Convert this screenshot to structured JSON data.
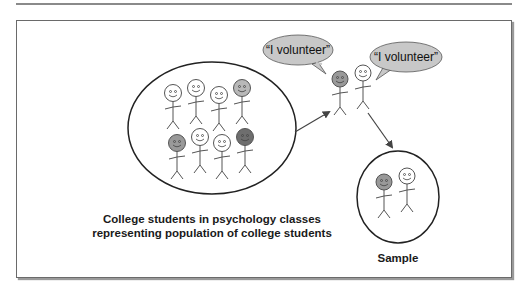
{
  "diagram": {
    "population": {
      "caption_line1": "College students in psychology classes",
      "caption_line2": "representing population of college students",
      "figures": [
        {
          "head": "white"
        },
        {
          "head": "white"
        },
        {
          "head": "white"
        },
        {
          "head": "light-gray"
        },
        {
          "head": "gray"
        },
        {
          "head": "white"
        },
        {
          "head": "white"
        },
        {
          "head": "dark-gray"
        }
      ]
    },
    "volunteers": {
      "bubble1_text": "“I volunteer”",
      "bubble2_text": "“I volunteer”",
      "figures": [
        {
          "head": "gray"
        },
        {
          "head": "white"
        }
      ]
    },
    "sample": {
      "label": "Sample",
      "figures": [
        {
          "head": "gray"
        },
        {
          "head": "white"
        }
      ]
    },
    "colors": {
      "bubble_fill": "#c8c8c8",
      "head_white": "#ffffff",
      "head_light_gray": "#b8b8b8",
      "head_gray": "#999999",
      "head_dark_gray": "#6e6e6e",
      "line": "#333333"
    }
  }
}
